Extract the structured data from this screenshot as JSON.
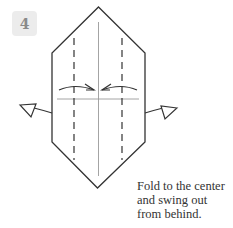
{
  "step": {
    "number": "4"
  },
  "caption": {
    "lines": [
      "Fold to the center",
      "and swing out",
      "from behind."
    ]
  },
  "diagram": {
    "shape": "elongated-hexagon",
    "stroke_color": "#333333",
    "fold_line_color": "#999999",
    "arrows": [
      "fold-to-center-left",
      "fold-to-center-right",
      "swing-out-left",
      "swing-out-right"
    ]
  }
}
